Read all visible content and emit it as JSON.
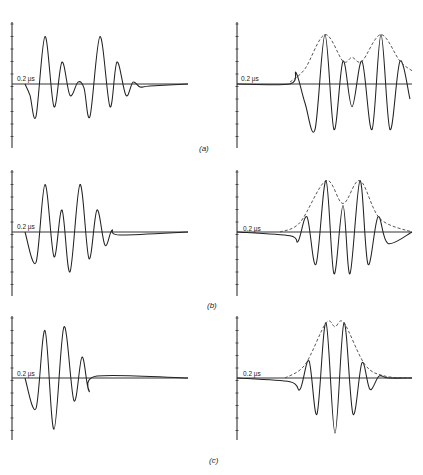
{
  "figure": {
    "panel_labels": [
      "(a)",
      "(b)",
      "(c)"
    ],
    "time_scale_label": "0.2 µs",
    "colors": {
      "trace": "#222222",
      "axis": "#333333",
      "envelope": "#444444",
      "background": "#ffffff"
    }
  },
  "chart_data": [
    {
      "type": "line",
      "panel": "(a)",
      "side": "left",
      "title": "",
      "annotation": "0.2 µs",
      "description": "Two-burst signal trace; each burst has 3 decaying positive peaks",
      "series": [
        {
          "name": "signal",
          "x": [
            25,
            30,
            36,
            45,
            54,
            62,
            70,
            78,
            84,
            90,
            100,
            110,
            117,
            126,
            133,
            140,
            150,
            188
          ],
          "y": [
            0,
            -0.3,
            -0.85,
            1.25,
            -0.6,
            0.58,
            -0.3,
            0.05,
            -0.1,
            -0.85,
            1.25,
            -0.6,
            0.58,
            -0.3,
            0.05,
            -0.08,
            -0.05,
            0
          ]
        }
      ],
      "xlabel": "",
      "ylabel": "",
      "grid": false
    },
    {
      "type": "line",
      "panel": "(a)",
      "side": "right",
      "annotation": "0.2 µs",
      "description": "Processed signal with dashed envelope, two main peaks",
      "series": [
        {
          "name": "signal",
          "x": [
            237,
            290,
            296,
            305,
            315,
            325,
            334,
            343,
            352,
            362,
            372,
            381,
            390,
            400,
            410
          ],
          "y": [
            0,
            0,
            0.3,
            -0.5,
            -1.2,
            1.3,
            -1.2,
            0.6,
            -0.6,
            0.6,
            -1.2,
            1.3,
            -1.2,
            0.6,
            -0.4
          ]
        },
        {
          "name": "envelope (dashed)",
          "x": [
            290,
            305,
            325,
            343,
            352,
            362,
            381,
            400,
            412
          ],
          "y": [
            0.05,
            0.4,
            1.3,
            0.6,
            0.7,
            0.6,
            1.3,
            0.6,
            0.35
          ]
        }
      ]
    },
    {
      "type": "line",
      "panel": "(b)",
      "side": "left",
      "annotation": "0.2 µs",
      "description": "Signal with overlapping bursts, peaks ~1.25, 0.58, 1.25, 0.58",
      "series": [
        {
          "name": "signal",
          "x": [
            25,
            36,
            45,
            54,
            62,
            70,
            80,
            89,
            97,
            105,
            112,
            120,
            188
          ],
          "y": [
            0,
            -0.8,
            1.25,
            -0.65,
            0.58,
            -1.05,
            1.25,
            -0.7,
            0.58,
            -0.35,
            0.05,
            -0.08,
            0
          ]
        }
      ]
    },
    {
      "type": "line",
      "panel": "(b)",
      "side": "right",
      "annotation": "0.2 µs",
      "description": "Processed signal with dashed envelope, two close peaks",
      "series": [
        {
          "name": "signal",
          "x": [
            237,
            290,
            298,
            307,
            316,
            326,
            334,
            343,
            350,
            360,
            368,
            378,
            388,
            412
          ],
          "y": [
            0,
            -0.1,
            -0.25,
            0.4,
            -0.85,
            1.35,
            -1.1,
            0.7,
            -1.1,
            1.35,
            -0.85,
            0.4,
            -0.3,
            0
          ]
        },
        {
          "name": "envelope (dashed)",
          "x": [
            280,
            300,
            326,
            343,
            360,
            380,
            412
          ],
          "y": [
            0,
            0.25,
            1.35,
            0.75,
            1.35,
            0.35,
            0
          ]
        }
      ]
    },
    {
      "type": "line",
      "panel": "(c)",
      "side": "left",
      "annotation": "0.2 µs",
      "description": "Signal with fully overlapped bursts, peaks ~1.25, 1.35, 0.55",
      "series": [
        {
          "name": "signal",
          "x": [
            25,
            36,
            45,
            54,
            64,
            74,
            82,
            89,
            97,
            188
          ],
          "y": [
            0,
            -0.8,
            1.25,
            -1.35,
            1.35,
            -0.6,
            0.55,
            -0.35,
            0.05,
            0
          ]
        }
      ]
    },
    {
      "type": "line",
      "panel": "(c)",
      "side": "right",
      "annotation": "0.2 µs",
      "description": "Processed signal with dashed envelope, single broad peak with slight dip",
      "series": [
        {
          "name": "signal",
          "x": [
            237,
            290,
            300,
            309,
            317,
            326,
            335,
            344,
            353,
            362,
            370,
            379,
            388,
            412
          ],
          "y": [
            0,
            -0.1,
            -0.3,
            0.45,
            -0.95,
            1.45,
            -1.45,
            1.45,
            -0.95,
            0.4,
            -0.3,
            0.05,
            0,
            0
          ]
        },
        {
          "name": "envelope (dashed)",
          "x": [
            285,
            305,
            326,
            335,
            344,
            365,
            385,
            412
          ],
          "y": [
            0,
            0.35,
            1.45,
            1.35,
            1.45,
            0.35,
            0.05,
            0
          ]
        }
      ]
    }
  ]
}
